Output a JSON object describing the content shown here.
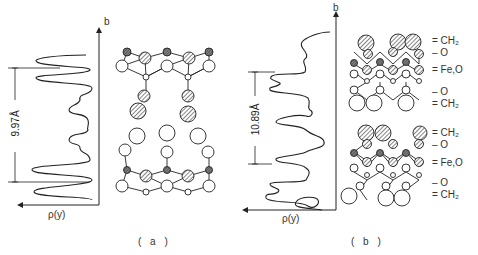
{
  "figure": {
    "panels": [
      {
        "id": "a",
        "caption": "( a )",
        "axis_y_label": "b",
        "axis_x_label": "ρ(y)",
        "dimension_label": "9.97Å",
        "description": "Electron density profile along b with bilayer structure: Fe,O layers top and bottom, hydrocarbon chains pointing inward"
      },
      {
        "id": "b",
        "caption": "( b )",
        "axis_y_label": "b",
        "axis_x_label": "ρ(y)",
        "dimension_label": "10.89Å",
        "description": "Electron density profile along b with stacked layered structure",
        "layer_labels": [
          "= CH₂",
          "– O",
          "= Fe,O",
          "– O",
          "= CH₂"
        ]
      }
    ],
    "colors": {
      "line": "#222222",
      "hatch": "#444444",
      "background": "#ffffff"
    }
  }
}
